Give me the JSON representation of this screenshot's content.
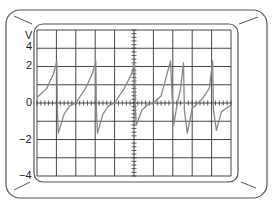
{
  "figure": {
    "unit_label": "V",
    "y_tick_labels": [
      {
        "text": "4",
        "y": 47
      },
      {
        "text": "2",
        "y": 66
      },
      {
        "text": "0",
        "y": 103
      },
      {
        "text": "−2",
        "y": 140
      },
      {
        "text": "−4",
        "y": 176
      }
    ]
  },
  "colors": {
    "bezel": "#555555",
    "grid": "#333333",
    "trace": "#888888",
    "background": "#ffffff"
  },
  "chart_data": {
    "type": "line",
    "title": "",
    "xlabel": "",
    "ylabel": "V",
    "ylim": [
      -4,
      4
    ],
    "y_ticks": [
      4,
      2,
      0,
      -2,
      -4
    ],
    "grid": {
      "on": true,
      "x_divisions": 10,
      "y_divisions": 8,
      "center_axis_ticks": true
    },
    "series": [
      {
        "name": "trace",
        "x_div": [
          0.0,
          0.5,
          0.85,
          1.02,
          1.05,
          1.1,
          1.4,
          1.7,
          2.0,
          2.5,
          2.85,
          3.03,
          3.06,
          3.12,
          3.4,
          3.7,
          4.0,
          4.5,
          4.88,
          5.03,
          5.07,
          5.12,
          5.4,
          5.7,
          6.0,
          6.4,
          6.88,
          7.0,
          7.05,
          7.2,
          7.4,
          7.55,
          7.6,
          7.75,
          8.0,
          8.5,
          8.88,
          9.05,
          9.1,
          9.25,
          9.5,
          10.0
        ],
        "values": [
          0.3,
          0.8,
          1.6,
          2.3,
          -0.4,
          -1.65,
          -0.6,
          -0.15,
          0.0,
          0.8,
          1.6,
          2.3,
          -0.4,
          -1.65,
          -0.6,
          -0.15,
          0.0,
          0.8,
          1.6,
          2.3,
          -0.4,
          -1.2,
          -0.4,
          -0.1,
          0.0,
          0.4,
          2.3,
          -0.4,
          -1.2,
          -0.2,
          0.8,
          2.2,
          -0.4,
          -1.65,
          -0.3,
          0.2,
          0.8,
          2.3,
          -0.4,
          -1.5,
          -0.5,
          -0.1
        ]
      }
    ]
  }
}
